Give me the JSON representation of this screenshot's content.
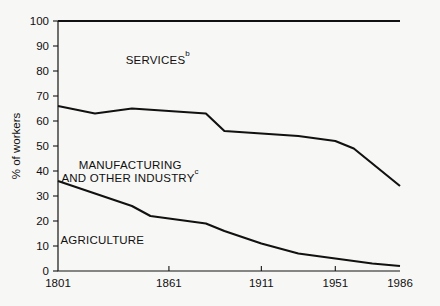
{
  "chart_data": {
    "type": "area",
    "title": "",
    "subtitle": "",
    "xlabel": "",
    "ylabel": "% of workers",
    "xlim": [
      1801,
      1986
    ],
    "ylim": [
      0,
      100
    ],
    "grid": false,
    "legend_position": "inline-annotations",
    "x_ticks": [
      {
        "value": 1801,
        "label": "1801"
      },
      {
        "value": 1861,
        "label": "1861"
      },
      {
        "value": 1911,
        "label": "1911"
      },
      {
        "value": 1951,
        "label": "1951"
      },
      {
        "value": 1986,
        "label": "1986"
      }
    ],
    "y_ticks": [
      {
        "value": 0,
        "label": "0"
      },
      {
        "value": 10,
        "label": "10"
      },
      {
        "value": 20,
        "label": "20"
      },
      {
        "value": 30,
        "label": "30"
      },
      {
        "value": 40,
        "label": "40"
      },
      {
        "value": 50,
        "label": "50"
      },
      {
        "value": 60,
        "label": "60"
      },
      {
        "value": 70,
        "label": "70"
      },
      {
        "value": 80,
        "label": "80"
      },
      {
        "value": 90,
        "label": "90"
      },
      {
        "value": 100,
        "label": "100"
      }
    ],
    "annotations": [
      {
        "id": "services",
        "text": "SERVICES",
        "superscript": "b",
        "x": 1855,
        "y": 83
      },
      {
        "id": "manufacturing",
        "text": "MANUFACTURING",
        "line2": "AND OTHER INDUSTRY",
        "superscript": "c",
        "x": 1840,
        "y": 41
      },
      {
        "id": "agriculture",
        "text": "AGRICULTURE",
        "superscript": "",
        "x": 1825,
        "y": 11
      }
    ],
    "boundaries": [
      {
        "name": "top of manufacturing and other industry (cumulative agriculture + industry)",
        "x": [
          1801,
          1821,
          1841,
          1861,
          1881,
          1891,
          1911,
          1931,
          1951,
          1961,
          1986
        ],
        "y": [
          66,
          63,
          65,
          64,
          63,
          56,
          55,
          54,
          52,
          49,
          34
        ]
      },
      {
        "name": "top of agriculture",
        "x": [
          1801,
          1821,
          1841,
          1851,
          1861,
          1881,
          1891,
          1911,
          1931,
          1951,
          1971,
          1986
        ],
        "y": [
          36,
          31,
          26,
          22,
          21,
          19,
          16,
          11,
          7,
          5,
          3,
          2
        ]
      },
      {
        "name": "chart ceiling (100%)",
        "x": [
          1801,
          1986
        ],
        "y": [
          100,
          100
        ]
      }
    ],
    "series": [
      {
        "name": "AGRICULTURE",
        "values_at_ticks": {
          "1801": 36,
          "1861": 21,
          "1911": 11,
          "1951": 5,
          "1986": 2
        }
      },
      {
        "name": "MANUFACTURING AND OTHER INDUSTRY",
        "values_at_ticks": {
          "1801": 30,
          "1861": 43,
          "1911": 44,
          "1951": 47,
          "1986": 32
        }
      },
      {
        "name": "SERVICES",
        "values_at_ticks": {
          "1801": 34,
          "1861": 36,
          "1911": 45,
          "1951": 48,
          "1986": 66
        }
      }
    ]
  }
}
